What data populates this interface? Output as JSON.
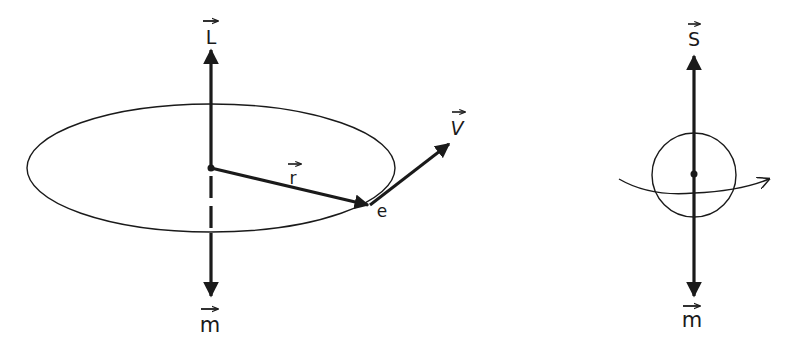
{
  "diagram": {
    "type": "physics-vector-diagram",
    "colors": {
      "ink": "#1a1a1a",
      "background": "#ffffff"
    },
    "left_panel": {
      "description": "Electron orbiting in an ellipse: orbital angular momentum and magnetic moment",
      "labels": {
        "angular_momentum": "L",
        "position_vector": "r",
        "velocity": "V",
        "electron": "e",
        "magnetic_moment": "m"
      },
      "vectors": [
        {
          "name": "L",
          "direction": "up",
          "has_arrow_accent": true
        },
        {
          "name": "r",
          "direction": "center-to-electron",
          "has_arrow_accent": true
        },
        {
          "name": "V",
          "direction": "tangent-up-right",
          "has_arrow_accent": true
        },
        {
          "name": "m",
          "direction": "down",
          "has_arrow_accent": true
        }
      ]
    },
    "right_panel": {
      "description": "Spinning particle: spin angular momentum and magnetic moment",
      "labels": {
        "spin": "S",
        "magnetic_moment": "m"
      },
      "vectors": [
        {
          "name": "S",
          "direction": "up",
          "has_arrow_accent": true
        },
        {
          "name": "m",
          "direction": "down",
          "has_arrow_accent": true
        }
      ],
      "rotation_indicator": "curved arrow around sphere, pointing right"
    }
  }
}
